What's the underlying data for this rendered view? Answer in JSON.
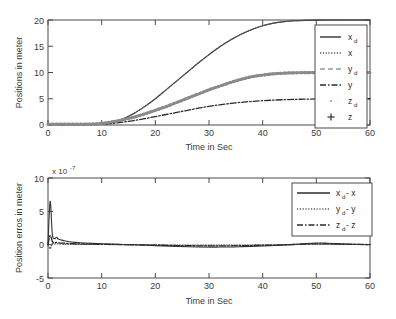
{
  "figure": {
    "panels": [
      {
        "id": "positions",
        "ylabel": "Positions in meter",
        "xlabel": "Time in Sec",
        "exponent_label": null,
        "legend": [
          {
            "base": "x",
            "sub": "d",
            "suffix": "",
            "style": "solid",
            "color": "#333333"
          },
          {
            "base": "x",
            "sub": "",
            "suffix": "",
            "style": "dotted",
            "color": "#555555"
          },
          {
            "base": "y",
            "sub": "d",
            "suffix": "",
            "style": "dashed",
            "color": "#9a9a9a"
          },
          {
            "base": "y",
            "sub": "",
            "suffix": "",
            "style": "dashdot",
            "color": "#2b2b2b"
          },
          {
            "base": "z",
            "sub": "d",
            "suffix": "",
            "style": "dot-marker",
            "color": "#8a8a8a"
          },
          {
            "base": "z",
            "sub": "",
            "suffix": "",
            "style": "plus-marker",
            "color": "#3a3a3a"
          }
        ]
      },
      {
        "id": "errors",
        "ylabel": "Position erros in meter",
        "xlabel": "Time in Sec",
        "exponent_label": "x 10",
        "exponent_sup": "-7",
        "legend": [
          {
            "base": "x",
            "sub": "d",
            "suffix": " - x",
            "style": "solid",
            "color": "#2b2b2b"
          },
          {
            "base": "y",
            "sub": "d",
            "suffix": " - y",
            "style": "dotted",
            "color": "#5a5a5a"
          },
          {
            "base": "z",
            "sub": "d",
            "suffix": " - z",
            "style": "dashdot",
            "color": "#2b2b2b"
          }
        ]
      }
    ]
  },
  "chart_data": [
    {
      "type": "line",
      "title": "",
      "xlabel": "Time in Sec",
      "ylabel": "Positions in meter",
      "xlim": [
        0,
        60
      ],
      "ylim": [
        0,
        20
      ],
      "xticks": [
        0,
        10,
        20,
        30,
        40,
        50,
        60
      ],
      "yticks": [
        0,
        5,
        10,
        15,
        20
      ],
      "grid": false,
      "legend_position": "right-inside",
      "x": [
        0,
        2,
        4,
        6,
        8,
        10,
        12,
        14,
        16,
        18,
        20,
        22,
        24,
        26,
        28,
        30,
        32,
        34,
        36,
        38,
        40,
        42,
        44,
        46,
        48,
        50,
        52,
        54,
        56,
        58,
        60
      ],
      "series": [
        {
          "name": "x_d",
          "style": "solid",
          "values": [
            0.1,
            0.1,
            0.1,
            0.1,
            0.1,
            0.15,
            0.5,
            1.2,
            2.2,
            3.5,
            5.0,
            6.7,
            8.4,
            10.1,
            11.8,
            13.4,
            14.9,
            16.2,
            17.3,
            18.2,
            18.9,
            19.4,
            19.7,
            19.85,
            19.93,
            19.97,
            19.99,
            20.0,
            20.0,
            20.0,
            20.0
          ]
        },
        {
          "name": "x",
          "style": "dotted",
          "values": [
            0.1,
            0.1,
            0.1,
            0.1,
            0.1,
            0.15,
            0.5,
            1.2,
            2.2,
            3.5,
            5.0,
            6.7,
            8.4,
            10.1,
            11.8,
            13.4,
            14.9,
            16.2,
            17.3,
            18.2,
            18.9,
            19.4,
            19.7,
            19.85,
            19.93,
            19.97,
            19.99,
            20.0,
            20.0,
            20.0,
            20.0
          ]
        },
        {
          "name": "y_d",
          "style": "dashed",
          "values": [
            0.15,
            0.15,
            0.15,
            0.15,
            0.18,
            0.3,
            0.6,
            1.0,
            1.5,
            2.1,
            2.8,
            3.5,
            4.3,
            5.1,
            5.9,
            6.7,
            7.4,
            8.1,
            8.7,
            9.2,
            9.5,
            9.75,
            9.88,
            9.94,
            9.97,
            9.99,
            10.0,
            10.0,
            10.0,
            10.0,
            10.0
          ]
        },
        {
          "name": "y",
          "style": "dashdot",
          "values": [
            0.05,
            0.05,
            0.05,
            0.05,
            0.06,
            0.12,
            0.3,
            0.55,
            0.85,
            1.2,
            1.6,
            2.0,
            2.4,
            2.8,
            3.2,
            3.55,
            3.85,
            4.1,
            4.32,
            4.5,
            4.63,
            4.74,
            4.82,
            4.88,
            4.93,
            4.96,
            4.98,
            5.0,
            5.0,
            5.0,
            5.0
          ]
        },
        {
          "name": "z_d",
          "style": "dot-marker",
          "values": [
            0.15,
            0.15,
            0.15,
            0.15,
            0.18,
            0.3,
            0.6,
            1.0,
            1.5,
            2.1,
            2.8,
            3.5,
            4.3,
            5.1,
            5.9,
            6.7,
            7.4,
            8.1,
            8.7,
            9.2,
            9.5,
            9.75,
            9.88,
            9.94,
            9.97,
            9.99,
            10.0,
            10.0,
            10.0,
            10.0,
            10.0
          ]
        },
        {
          "name": "z",
          "style": "plus-marker",
          "values": [
            0.15,
            0.15,
            0.15,
            0.15,
            0.18,
            0.3,
            0.6,
            1.0,
            1.5,
            2.1,
            2.8,
            3.5,
            4.3,
            5.1,
            5.9,
            6.7,
            7.4,
            8.1,
            8.7,
            9.2,
            9.5,
            9.75,
            9.88,
            9.94,
            9.97,
            9.99,
            10.0,
            10.0,
            10.0,
            10.0,
            10.0
          ]
        }
      ]
    },
    {
      "type": "line",
      "title": "",
      "xlabel": "Time in Sec",
      "ylabel": "Position erros in meter",
      "y_exponent": "x 10^-7",
      "xlim": [
        0,
        60
      ],
      "ylim": [
        -5,
        10
      ],
      "xticks": [
        0,
        10,
        20,
        30,
        40,
        50,
        60
      ],
      "yticks": [
        -5,
        0,
        5,
        10
      ],
      "grid": false,
      "legend_position": "top-right-inside",
      "x": [
        0,
        0.4,
        0.8,
        1.2,
        1.6,
        2,
        3,
        4,
        5,
        6,
        8,
        10,
        12,
        14,
        16,
        18,
        20,
        24,
        28,
        32,
        36,
        40,
        44,
        46,
        48,
        50,
        52,
        56,
        60
      ],
      "series": [
        {
          "name": "x_d - x",
          "style": "solid",
          "values": [
            0.0,
            6.5,
            1.6,
            0.9,
            1.1,
            0.8,
            0.6,
            0.45,
            0.35,
            0.28,
            0.2,
            0.14,
            0.08,
            0.03,
            -0.02,
            -0.08,
            -0.14,
            -0.26,
            -0.34,
            -0.36,
            -0.3,
            -0.2,
            -0.05,
            0.05,
            0.18,
            0.25,
            0.22,
            0.1,
            0.02
          ]
        },
        {
          "name": "y_d - y",
          "style": "dotted",
          "values": [
            0.0,
            -0.6,
            0.2,
            0.1,
            0.15,
            0.1,
            0.08,
            0.06,
            0.05,
            0.04,
            0.03,
            0.02,
            0.01,
            0.0,
            -0.01,
            -0.02,
            -0.03,
            -0.05,
            -0.06,
            -0.06,
            -0.05,
            -0.03,
            0.0,
            0.02,
            0.05,
            0.07,
            0.06,
            0.03,
            0.01
          ]
        },
        {
          "name": "z_d - z",
          "style": "dashdot",
          "values": [
            0.0,
            1.4,
            0.5,
            0.3,
            0.35,
            0.28,
            0.22,
            0.18,
            0.14,
            0.11,
            0.08,
            0.06,
            0.04,
            0.01,
            -0.01,
            -0.04,
            -0.07,
            -0.13,
            -0.17,
            -0.18,
            -0.15,
            -0.1,
            -0.02,
            0.03,
            0.09,
            0.13,
            0.11,
            0.05,
            0.01
          ]
        }
      ]
    }
  ],
  "colors": {
    "axis": "#4a4a4a",
    "text": "#2a2a2a",
    "band": "#8a8a8a",
    "primary": "#2b2b2b"
  }
}
